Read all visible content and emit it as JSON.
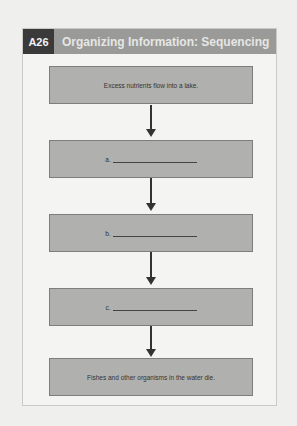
{
  "header": {
    "badge": "A26",
    "title": "Organizing Information: Sequencing",
    "badge_color": "#3a3a3a",
    "bar_color": "#9a9a98"
  },
  "flow": {
    "steps": [
      {
        "text": "Excess nutrients flow into a lake."
      },
      {
        "label": "a.",
        "blank": true
      },
      {
        "label": "b.",
        "blank": true
      },
      {
        "label": "c.",
        "blank": true
      },
      {
        "text": "Fishes and other organisms in the water die."
      }
    ]
  }
}
